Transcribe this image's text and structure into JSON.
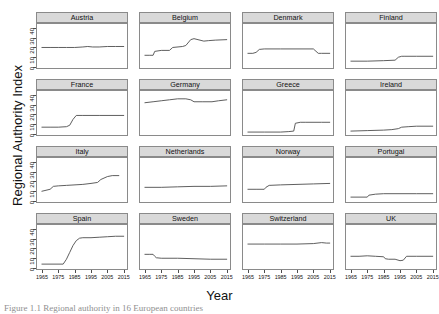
{
  "chart_data": {
    "type": "line",
    "title": "",
    "subtitle": "",
    "xlabel": "Year",
    "ylabel": "Regional Authority Index",
    "xlim": [
      1962,
      2017
    ],
    "ylim": [
      0,
      45
    ],
    "xticks": [
      1965,
      1975,
      1985,
      1995,
      2005,
      2015
    ],
    "xticklabels": [
      "1965",
      "1975",
      "1985",
      "1995",
      "2005",
      "2015"
    ],
    "yticks": [
      0,
      10,
      20,
      30,
      40
    ],
    "yticklabels": [
      "0",
      "10",
      "20",
      "30",
      "40"
    ],
    "grid": false,
    "legend": "none",
    "layout": {
      "rows": 4,
      "cols": 4,
      "facet": "country"
    },
    "line_color": "#4d4d4d",
    "strip_color": "#d9d9d9",
    "panels": [
      {
        "name": "Austria",
        "x": [
          1965,
          1970,
          1975,
          1980,
          1985,
          1990,
          1993,
          1996,
          2000,
          2005,
          2010,
          2015
        ],
        "y": [
          21,
          21,
          21,
          21,
          21,
          21.5,
          22,
          21.5,
          21.5,
          22,
          22,
          22
        ]
      },
      {
        "name": "Belgium",
        "x": [
          1965,
          1968,
          1970,
          1971,
          1975,
          1980,
          1982,
          1988,
          1990,
          1993,
          1995,
          2001,
          2004,
          2008,
          2015
        ],
        "y": [
          13,
          13,
          13,
          17,
          18,
          18,
          21,
          22,
          23,
          29,
          30,
          27.5,
          28,
          28.5,
          29
        ]
      },
      {
        "name": "Denmark",
        "x": [
          1965,
          1968,
          1970,
          1972,
          1975,
          1985,
          1995,
          2005,
          2006,
          2008,
          2010,
          2015
        ],
        "y": [
          15,
          15,
          16,
          19,
          19.5,
          19.5,
          19.5,
          19.5,
          18,
          15,
          15,
          15
        ]
      },
      {
        "name": "Finland",
        "x": [
          1965,
          1975,
          1985,
          1992,
          1994,
          1996,
          1998,
          2005,
          2015
        ],
        "y": [
          7,
          7,
          7.5,
          8,
          11,
          12,
          12,
          12,
          12
        ]
      },
      {
        "name": "France",
        "x": [
          1965,
          1970,
          1975,
          1980,
          1982,
          1984,
          1986,
          1990,
          2000,
          2015
        ],
        "y": [
          8,
          8,
          8,
          8.5,
          10,
          16,
          20,
          20,
          20,
          20
        ]
      },
      {
        "name": "Germany",
        "x": [
          1965,
          1970,
          1975,
          1980,
          1985,
          1990,
          1993,
          1995,
          2000,
          2006,
          2010,
          2015
        ],
        "y": [
          33,
          34,
          35,
          36,
          37,
          37,
          36,
          34,
          34,
          34,
          35,
          36
        ]
      },
      {
        "name": "Greece",
        "x": [
          1965,
          1975,
          1985,
          1990,
          1993,
          1994,
          1997,
          2000,
          2010,
          2015
        ],
        "y": [
          3,
          3,
          3,
          3.5,
          4,
          12,
          13,
          13,
          13,
          13
        ]
      },
      {
        "name": "Ireland",
        "x": [
          1965,
          1975,
          1985,
          1990,
          1994,
          1996,
          2000,
          2005,
          2015
        ],
        "y": [
          4,
          4.5,
          5,
          5.5,
          6.5,
          8,
          8.5,
          9,
          9
        ]
      },
      {
        "name": "Italy",
        "x": [
          1965,
          1970,
          1972,
          1975,
          1980,
          1990,
          1995,
          1999,
          2001,
          2005,
          2008,
          2012
        ],
        "y": [
          11,
          13,
          16,
          16.5,
          17,
          18,
          19,
          20,
          23,
          26,
          27,
          27
        ]
      },
      {
        "name": "Netherlands",
        "x": [
          1965,
          1975,
          1985,
          1995,
          2005,
          2015
        ],
        "y": [
          15,
          15,
          15.5,
          16,
          16,
          16.5
        ]
      },
      {
        "name": "Norway",
        "x": [
          1965,
          1970,
          1975,
          1976,
          1978,
          1985,
          1995,
          2005,
          2015
        ],
        "y": [
          13,
          13,
          13,
          15,
          17,
          17.5,
          18,
          18.5,
          19
        ]
      },
      {
        "name": "Portugal",
        "x": [
          1965,
          1975,
          1976,
          1980,
          1985,
          1995,
          2005,
          2015
        ],
        "y": [
          5,
          5,
          7,
          8,
          8.5,
          8.5,
          8.5,
          8.5
        ]
      },
      {
        "name": "Spain",
        "x": [
          1965,
          1978,
          1980,
          1982,
          1984,
          1986,
          1988,
          1990,
          1995,
          2000,
          2005,
          2010,
          2015
        ],
        "y": [
          5,
          5,
          10,
          17,
          24,
          29,
          31.5,
          32,
          32,
          32.5,
          33,
          33.5,
          33.5
        ]
      },
      {
        "name": "Sweden",
        "x": [
          1965,
          1968,
          1970,
          1971,
          1972,
          1975,
          1985,
          1995,
          2005,
          2015
        ],
        "y": [
          15,
          15,
          15,
          13,
          11.5,
          11,
          11,
          10.5,
          10,
          10
        ]
      },
      {
        "name": "Switzerland",
        "x": [
          1965,
          1975,
          1985,
          1995,
          2005,
          2010,
          2013,
          2015
        ],
        "y": [
          25.5,
          25.5,
          25.5,
          25.5,
          26,
          27,
          26.5,
          26.5
        ]
      },
      {
        "name": "UK",
        "x": [
          1965,
          1970,
          1975,
          1980,
          1985,
          1986,
          1988,
          1992,
          1995,
          1997,
          1999,
          2005,
          2015
        ],
        "y": [
          13,
          13,
          13.5,
          13,
          12.5,
          10.5,
          10,
          10,
          8.5,
          9,
          13,
          13,
          13
        ]
      }
    ]
  },
  "figure": {
    "ylabel": "Regional Authority Index",
    "xlabel": "Year",
    "caption": "Figure 1.1 Regional authority in 16 European countries"
  }
}
